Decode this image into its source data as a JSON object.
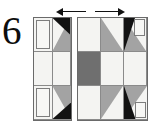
{
  "figure": {
    "number": "6",
    "caption_present": false
  },
  "arrows": [
    {
      "name": "arrow-left",
      "direction": "left",
      "glyph": "←"
    },
    {
      "name": "arrow-right",
      "direction": "right",
      "glyph": "→"
    }
  ],
  "palette": {
    "background": "#ffffff",
    "outline": "#6a6a6a",
    "seam_line": "#8a8a8a",
    "light_fabric": "#f4f4f2",
    "medium_fabric": "#a3a3a3",
    "dark_fabric": "#6f6f6f",
    "black_fabric": "#121212",
    "ink": "#0d0d0d"
  },
  "blocks": [
    {
      "name": "partial-block-left",
      "label": "left partial block",
      "columns": 2,
      "rows": 3,
      "cells": [
        {
          "row": 1,
          "col": 1,
          "unit": "corner-square-on-light",
          "fill": "light"
        },
        {
          "row": 1,
          "col": 2,
          "unit": "half-square-triangle-with-black-geese",
          "fill": "medium"
        },
        {
          "row": 2,
          "col": 1,
          "unit": "plain-square",
          "fill": "light"
        },
        {
          "row": 2,
          "col": 2,
          "unit": "plain-square",
          "fill": "light"
        },
        {
          "row": 3,
          "col": 1,
          "unit": "corner-square-on-light",
          "fill": "light"
        },
        {
          "row": 3,
          "col": 2,
          "unit": "half-square-triangle-with-black-geese",
          "fill": "medium"
        }
      ]
    },
    {
      "name": "full-block-right",
      "label": "right full block",
      "columns": 3,
      "rows": 3,
      "cells": [
        {
          "row": 1,
          "col": 1,
          "unit": "plain-square",
          "fill": "light"
        },
        {
          "row": 1,
          "col": 2,
          "unit": "half-square-triangle",
          "fill": "medium"
        },
        {
          "row": 1,
          "col": 3,
          "unit": "corner-square-on-light",
          "fill": "light"
        },
        {
          "row": 2,
          "col": 1,
          "unit": "plain-square",
          "fill": "dark"
        },
        {
          "row": 2,
          "col": 2,
          "unit": "plain-square",
          "fill": "light"
        },
        {
          "row": 2,
          "col": 3,
          "unit": "plain-square",
          "fill": "light"
        },
        {
          "row": 3,
          "col": 1,
          "unit": "plain-square",
          "fill": "light"
        },
        {
          "row": 3,
          "col": 2,
          "unit": "half-square-triangle",
          "fill": "medium"
        },
        {
          "row": 3,
          "col": 3,
          "unit": "corner-square-on-light",
          "fill": "light"
        }
      ]
    }
  ]
}
